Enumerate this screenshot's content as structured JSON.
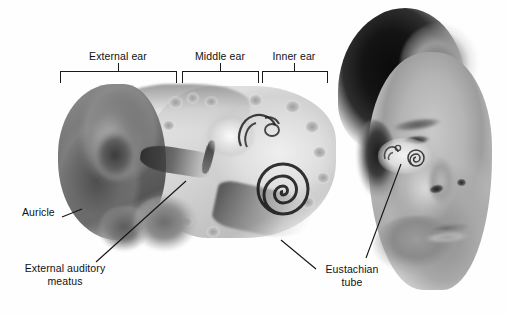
{
  "figure": {
    "background_color": "#ffffff",
    "width": 507,
    "height": 316
  },
  "region_brackets": [
    {
      "id": "external-ear",
      "label": "External ear",
      "x_start": 60,
      "x_end": 176,
      "tick_x": 118,
      "label_x": 118,
      "label_y": 50
    },
    {
      "id": "middle-ear",
      "label": "Middle ear",
      "x_start": 182,
      "x_end": 258,
      "tick_x": 220,
      "label_x": 220,
      "label_y": 50
    },
    {
      "id": "inner-ear",
      "label": "Inner ear",
      "x_start": 262,
      "x_end": 327,
      "tick_x": 294,
      "label_x": 294,
      "label_y": 50
    }
  ],
  "callouts": [
    {
      "id": "auricle",
      "label": "Auricle",
      "label_x": 22,
      "label_y": 206,
      "leader": {
        "x1": 62,
        "y1": 217,
        "x2": 82,
        "y2": 209
      }
    },
    {
      "id": "external-auditory-meatus",
      "label_line1": "External auditory",
      "label_line2": "meatus",
      "label_x": 14,
      "label_y": 262,
      "leader": {
        "x1": 96,
        "y1": 262,
        "x2": 186,
        "y2": 181
      }
    },
    {
      "id": "eustachian-tube",
      "label_line1": "Eustachian",
      "label_line2": "tube",
      "label_x": 322,
      "label_y": 266,
      "leader_left": {
        "x1": 316,
        "y1": 269,
        "x2": 281,
        "y2": 240
      },
      "leader_right": {
        "x1": 366,
        "y1": 258,
        "x2": 401,
        "y2": 164
      }
    }
  ],
  "anatomy_parts": [
    "auricle",
    "external auditory meatus",
    "tympanic membrane",
    "ossicles",
    "semicircular canals",
    "cochlea",
    "eustachian tube",
    "temporal bone"
  ],
  "face_inset": {
    "description": "grayscale three-quarter view of a head showing inner ear position",
    "shows": [
      "cochlea",
      "semicircular canals"
    ]
  },
  "colors": {
    "line": "#1a1a1a",
    "text": "#111111",
    "background": "#ffffff"
  }
}
